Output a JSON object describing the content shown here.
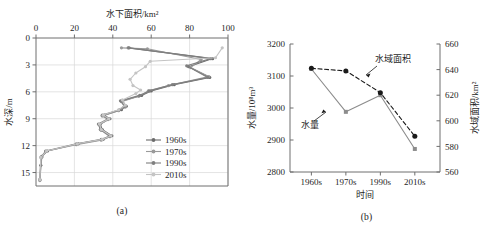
{
  "figure": {
    "panel_a_caption": "(a)",
    "panel_b_caption": "(b)"
  },
  "chart_data": [
    {
      "panel": "(a)",
      "type": "line",
      "title": "水下面积/km²",
      "xlabel": "水下面积/km²",
      "ylabel": "水深/m",
      "x_axis_position": "top",
      "y_axis_inverted": true,
      "xlim": [
        0,
        100
      ],
      "ylim": [
        0,
        16.5
      ],
      "xticks": [
        0,
        20,
        40,
        60,
        80,
        100
      ],
      "yticks": [
        0,
        3,
        6,
        9,
        12,
        15
      ],
      "grid": true,
      "legend_position": "inside-lower-right",
      "series": [
        {
          "name": "1960s",
          "color": "#6b6b6b",
          "points": [
            [
              48.0,
              1.1
            ],
            [
              92.0,
              2.3
            ],
            [
              79.5,
              3.2
            ],
            [
              90.5,
              4.4
            ],
            [
              72.0,
              5.2
            ],
            [
              60.0,
              5.9
            ],
            [
              55.0,
              6.4
            ],
            [
              45.0,
              7.0
            ],
            [
              47.0,
              7.6
            ],
            [
              44.5,
              8.0
            ],
            [
              35.5,
              8.6
            ],
            [
              38.5,
              9.0
            ],
            [
              33.5,
              9.6
            ],
            [
              34.5,
              10.2
            ],
            [
              39.5,
              10.9
            ],
            [
              35.0,
              11.3
            ],
            [
              22.0,
              11.8
            ],
            [
              6.0,
              12.6
            ],
            [
              3.0,
              13.2
            ],
            [
              2.5,
              14.2
            ],
            [
              2.0,
              15.8
            ]
          ]
        },
        {
          "name": "1970s",
          "color": "#9a9a9a",
          "points": [
            [
              44.5,
              1.1
            ],
            [
              58.0,
              1.2
            ],
            [
              86.0,
              2.4
            ],
            [
              80.5,
              3.3
            ],
            [
              90.0,
              4.3
            ],
            [
              69.0,
              5.3
            ],
            [
              58.5,
              5.9
            ],
            [
              53.5,
              6.5
            ],
            [
              44.5,
              7.1
            ],
            [
              46.5,
              7.7
            ],
            [
              43.0,
              8.1
            ],
            [
              34.5,
              8.7
            ],
            [
              37.5,
              9.1
            ],
            [
              33.0,
              9.7
            ],
            [
              34.0,
              10.3
            ],
            [
              38.5,
              11.0
            ],
            [
              34.0,
              11.4
            ],
            [
              21.0,
              11.9
            ],
            [
              5.5,
              12.6
            ],
            [
              3.0,
              13.3
            ],
            [
              2.0,
              15.9
            ]
          ]
        },
        {
          "name": "1990s",
          "color": "#7f7f7f",
          "points": [
            [
              48.5,
              1.1
            ],
            [
              91.0,
              2.3
            ],
            [
              78.5,
              3.1
            ],
            [
              89.5,
              4.4
            ],
            [
              71.0,
              5.2
            ],
            [
              59.0,
              5.9
            ],
            [
              54.0,
              6.4
            ],
            [
              44.0,
              7.0
            ],
            [
              46.0,
              7.6
            ],
            [
              43.5,
              8.0
            ],
            [
              34.5,
              8.6
            ],
            [
              37.5,
              9.0
            ],
            [
              32.5,
              9.6
            ],
            [
              33.5,
              10.2
            ],
            [
              38.5,
              10.9
            ],
            [
              34.0,
              11.3
            ],
            [
              21.0,
              11.8
            ],
            [
              5.0,
              12.6
            ],
            [
              2.5,
              13.3
            ],
            [
              2.0,
              15.8
            ]
          ]
        },
        {
          "name": "2010s",
          "color": "#c4c4c4",
          "points": [
            [
              97.0,
              1.1
            ],
            [
              93.5,
              2.2
            ],
            [
              59.5,
              2.6
            ],
            [
              57.0,
              3.2
            ],
            [
              52.0,
              3.9
            ],
            [
              49.0,
              4.6
            ],
            [
              50.5,
              5.3
            ],
            [
              54.5,
              5.8
            ],
            [
              52.0,
              6.2
            ],
            [
              45.0,
              6.9
            ],
            [
              46.5,
              7.5
            ],
            [
              43.0,
              8.0
            ],
            [
              35.0,
              8.6
            ],
            [
              38.0,
              9.0
            ],
            [
              33.0,
              9.6
            ],
            [
              34.0,
              10.2
            ],
            [
              39.0,
              10.9
            ],
            [
              34.5,
              11.3
            ],
            [
              21.5,
              11.8
            ],
            [
              5.5,
              12.6
            ],
            [
              2.5,
              13.3
            ],
            [
              2.0,
              15.8
            ]
          ]
        }
      ]
    },
    {
      "panel": "(b)",
      "type": "line",
      "title": "",
      "xlabel": "时间",
      "ylabel_left": "水量/10⁸m³",
      "ylabel_right": "水域面积/km²",
      "categories": [
        "1960s",
        "1970s",
        "1990s",
        "2010s"
      ],
      "ylim_left": [
        2800,
        3200
      ],
      "yticks_left": [
        2800,
        2900,
        3000,
        3100,
        3200
      ],
      "ylim_right": [
        560,
        660
      ],
      "yticks_right": [
        560,
        580,
        600,
        620,
        640,
        660
      ],
      "grid": false,
      "annotations": [
        {
          "text": "水域面积",
          "series": "水域面积"
        },
        {
          "text": "水量",
          "series": "水量"
        }
      ],
      "series": [
        {
          "name": "水量",
          "axis": "left",
          "style": "solid",
          "color": "#8c8c8c",
          "marker": "square",
          "values": [
            3122,
            2988,
            3040,
            2872
          ]
        },
        {
          "name": "水域面积",
          "axis": "right",
          "style": "dashed",
          "color": "#1a1a1a",
          "marker": "circle",
          "values": [
            641,
            639,
            622,
            588
          ]
        }
      ]
    }
  ]
}
